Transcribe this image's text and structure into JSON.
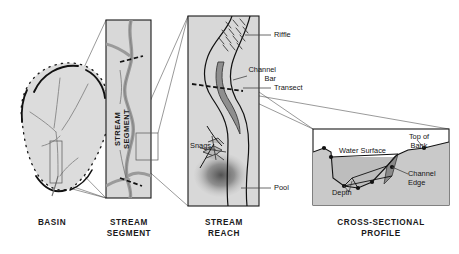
{
  "figure": {
    "background_color": "#ffffff",
    "panel_fill": "#d8d8d8",
    "panel_stroke": "#1a1a1a",
    "water_fill": "#9a9a9a",
    "ink": "#1a1a1a"
  },
  "panels": [
    {
      "id": "basin",
      "caption": "BASIN",
      "caption_lines": "BASIN",
      "shape": "dashed-outline watershed blob with tributary network",
      "callouts": []
    },
    {
      "id": "stream-segment",
      "caption": "STREAM\nSEGMENT",
      "caption_lines": "STREAM\nSEGMENT",
      "inner_label": "STREAM\nSEGMENT",
      "shape": "tall rectangle containing meandering stream and tributary junction",
      "callouts": []
    },
    {
      "id": "stream-reach",
      "caption": "STREAM\nREACH",
      "caption_lines": "STREAM\nREACH",
      "shape": "tall rectangle containing meander bend, bar, pool and snags",
      "callouts": [
        {
          "key": "riffle",
          "label": "Riffle"
        },
        {
          "key": "channel-bar",
          "label": "Channel\nBar"
        },
        {
          "key": "transect",
          "label": "Transect"
        },
        {
          "key": "snags",
          "label": "Snags"
        },
        {
          "key": "pool",
          "label": "Pool"
        }
      ]
    },
    {
      "id": "cross-sectional-profile",
      "caption": "CROSS-SECTIONAL\nPROFILE",
      "caption_lines": "CROSS-SECTIONAL\nPROFILE",
      "shape": "channel cross-section with water surface line and survey points",
      "callouts": [
        {
          "key": "top-of-bank",
          "label": "Top of\nBank"
        },
        {
          "key": "water-surface",
          "label": "Water Surface"
        },
        {
          "key": "channel-edge",
          "label": "Channel\nEdge"
        },
        {
          "key": "depth",
          "label": "Depth"
        }
      ]
    }
  ],
  "labels": {
    "basin": "BASIN",
    "stream_segment": "STREAM\nSEGMENT",
    "stream_segment_vertical": "STREAM\nSEGMENT",
    "stream_reach": "STREAM\nREACH",
    "cross_sectional_profile": "CROSS-SECTIONAL\nPROFILE",
    "riffle": "Riffle",
    "channel_bar": "Channel\nBar",
    "transect": "Transect",
    "snags": "Snags",
    "pool": "Pool",
    "top_of_bank": "Top of\nBank",
    "water_surface": "Water Surface",
    "channel_edge": "Channel\nEdge",
    "depth": "Depth"
  }
}
